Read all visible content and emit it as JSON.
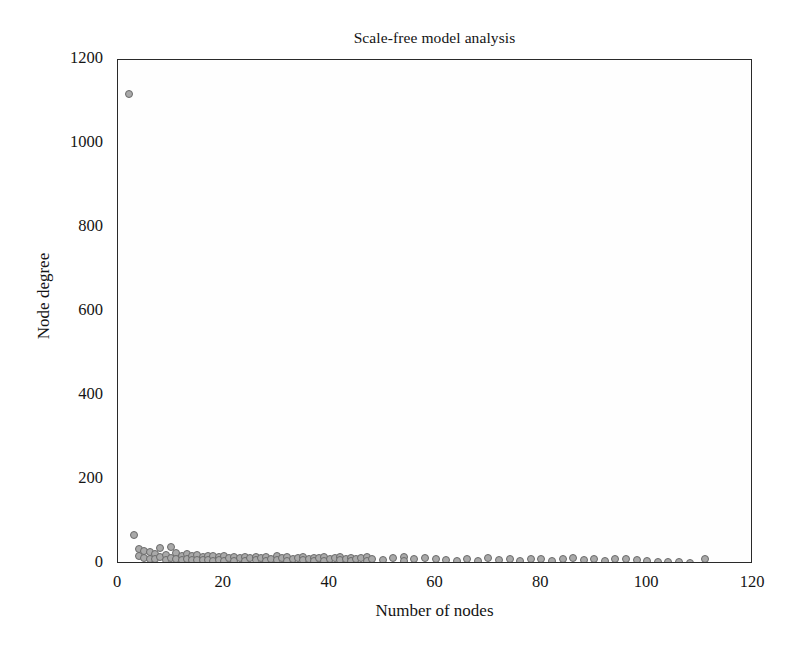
{
  "chart_data": {
    "type": "scatter",
    "title": "Scale-free model analysis",
    "xlabel": "Number of nodes",
    "ylabel": "Node degree",
    "xlim": [
      0,
      120
    ],
    "ylim": [
      0,
      1200
    ],
    "xticks": [
      0,
      20,
      40,
      60,
      80,
      100,
      120
    ],
    "yticks": [
      0,
      200,
      400,
      600,
      800,
      1000,
      1200
    ],
    "grid": false,
    "legend": null,
    "marker": {
      "shape": "circle",
      "fill_color": "#a9a9a9",
      "edge_color": "#6a6a6a",
      "size_px": 8
    },
    "series": [
      {
        "name": "Node degree vs number of nodes",
        "points": [
          [
            2,
            1120
          ],
          [
            3,
            70
          ],
          [
            4,
            35
          ],
          [
            4,
            18
          ],
          [
            5,
            30
          ],
          [
            5,
            14
          ],
          [
            6,
            28
          ],
          [
            6,
            12
          ],
          [
            7,
            24
          ],
          [
            7,
            11
          ],
          [
            8,
            38
          ],
          [
            8,
            16
          ],
          [
            9,
            22
          ],
          [
            9,
            10
          ],
          [
            10,
            40
          ],
          [
            10,
            15
          ],
          [
            11,
            26
          ],
          [
            11,
            12
          ],
          [
            12,
            20
          ],
          [
            12,
            10
          ],
          [
            13,
            24
          ],
          [
            13,
            11
          ],
          [
            14,
            18
          ],
          [
            14,
            9
          ],
          [
            15,
            22
          ],
          [
            15,
            10
          ],
          [
            16,
            16
          ],
          [
            16,
            9
          ],
          [
            17,
            20
          ],
          [
            17,
            10
          ],
          [
            18,
            18
          ],
          [
            18,
            8
          ],
          [
            19,
            16
          ],
          [
            19,
            9
          ],
          [
            20,
            19
          ],
          [
            20,
            8
          ],
          [
            21,
            15
          ],
          [
            22,
            17
          ],
          [
            22,
            8
          ],
          [
            23,
            14
          ],
          [
            24,
            16
          ],
          [
            24,
            8
          ],
          [
            25,
            15
          ],
          [
            26,
            17
          ],
          [
            26,
            9
          ],
          [
            27,
            14
          ],
          [
            28,
            16
          ],
          [
            28,
            8
          ],
          [
            29,
            13
          ],
          [
            30,
            18
          ],
          [
            30,
            9
          ],
          [
            31,
            14
          ],
          [
            32,
            16
          ],
          [
            32,
            8
          ],
          [
            33,
            13
          ],
          [
            34,
            15
          ],
          [
            35,
            17
          ],
          [
            35,
            9
          ],
          [
            36,
            13
          ],
          [
            37,
            15
          ],
          [
            37,
            8
          ],
          [
            38,
            14
          ],
          [
            39,
            16
          ],
          [
            39,
            8
          ],
          [
            40,
            13
          ],
          [
            41,
            15
          ],
          [
            42,
            17
          ],
          [
            42,
            9
          ],
          [
            43,
            13
          ],
          [
            44,
            15
          ],
          [
            44,
            8
          ],
          [
            45,
            12
          ],
          [
            46,
            14
          ],
          [
            47,
            16
          ],
          [
            47,
            8
          ],
          [
            48,
            12
          ],
          [
            50,
            10
          ],
          [
            52,
            14
          ],
          [
            54,
            16
          ],
          [
            54,
            8
          ],
          [
            56,
            12
          ],
          [
            58,
            15
          ],
          [
            60,
            13
          ],
          [
            62,
            9
          ],
          [
            64,
            6
          ],
          [
            66,
            12
          ],
          [
            68,
            7
          ],
          [
            70,
            14
          ],
          [
            72,
            9
          ],
          [
            74,
            12
          ],
          [
            76,
            8
          ],
          [
            78,
            11
          ],
          [
            80,
            13
          ],
          [
            82,
            7
          ],
          [
            84,
            12
          ],
          [
            86,
            14
          ],
          [
            88,
            10
          ],
          [
            90,
            12
          ],
          [
            92,
            8
          ],
          [
            94,
            11
          ],
          [
            96,
            13
          ],
          [
            98,
            9
          ],
          [
            100,
            6
          ],
          [
            102,
            5
          ],
          [
            104,
            4
          ],
          [
            106,
            4
          ],
          [
            108,
            3
          ],
          [
            111,
            12
          ]
        ]
      }
    ]
  }
}
